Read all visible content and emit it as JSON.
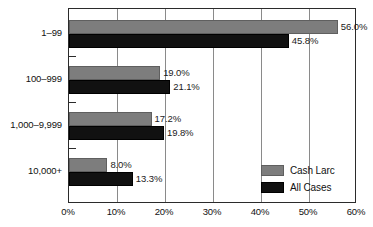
{
  "chart_data": {
    "type": "bar",
    "orientation": "horizontal",
    "title": "",
    "subtitle": "",
    "xlabel": "",
    "ylabel": "",
    "categories": [
      "1–99",
      "100–999",
      "1,000–9,999",
      "10,000+"
    ],
    "series": [
      {
        "name": "Cash Larc",
        "color": "#7d7d7d",
        "values": [
          56.0,
          19.0,
          17.2,
          8.0
        ],
        "labels": [
          "56.0%",
          "19.0%",
          "17.2%",
          "8.0%"
        ]
      },
      {
        "name": "All Cases",
        "color": "#111111",
        "values": [
          45.8,
          21.1,
          19.8,
          13.3
        ],
        "labels": [
          "45.8%",
          "21.1%",
          "19.8%",
          "13.3%"
        ]
      }
    ],
    "xlim": [
      0,
      60
    ],
    "xticks": [
      0,
      10,
      20,
      30,
      40,
      50,
      60
    ],
    "xtick_labels": [
      "0%",
      "10%",
      "20%",
      "30%",
      "40%",
      "50%",
      "60%"
    ],
    "grid": "vertical",
    "legend_position": "bottom-right"
  },
  "legend": {
    "items": [
      {
        "label": "Cash Larc",
        "swatch": "gray-swatch"
      },
      {
        "label": "All Cases",
        "swatch": "black-swatch"
      }
    ]
  },
  "axis": {
    "y_categories": [
      "1–99",
      "100–999",
      "1,000–9,999",
      "10,000+"
    ],
    "x_tick_labels": [
      "0%",
      "10%",
      "20%",
      "30%",
      "40%",
      "50%",
      "60%"
    ]
  },
  "colors": {
    "series_cash": "#7d7d7d",
    "series_all": "#111111",
    "frame": "#2b2b2b",
    "grid": "#8a8a8a",
    "background": "#ffffff"
  }
}
